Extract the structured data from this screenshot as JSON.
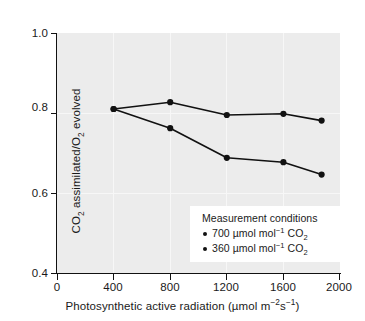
{
  "chart_data": {
    "type": "line",
    "title": "",
    "xlabel": "Photosynthetic active radiation (µmol m⁻²s⁻¹)",
    "ylabel": "CO₂ assimilated/O₂ evolved",
    "xlim": [
      0,
      2000
    ],
    "ylim": [
      0.4,
      1.0
    ],
    "xticks": [
      0,
      400,
      800,
      1200,
      1600,
      2000
    ],
    "xtick_labels": [
      "0",
      "400",
      "800",
      "1200",
      "1600",
      "2000"
    ],
    "yticks": [
      0.4,
      0.6,
      0.8,
      1.0
    ],
    "ytick_labels": [
      "0.4",
      "0.6",
      "0.8",
      "1.0"
    ],
    "grid": true,
    "legend_position": "lower right",
    "legend_title": "Measurement conditions",
    "marker": "circle-filled",
    "series": [
      {
        "name": "700 µmol mol⁻¹ CO₂",
        "x": [
          400,
          800,
          1200,
          1600,
          1870
        ],
        "y": [
          0.81,
          0.827,
          0.795,
          0.798,
          0.781
        ]
      },
      {
        "name": "360 µmol mol⁻¹ CO₂",
        "x": [
          400,
          800,
          1200,
          1600,
          1870
        ],
        "y": [
          0.81,
          0.762,
          0.688,
          0.677,
          0.646
        ]
      }
    ],
    "colors": {
      "line": "#111111",
      "marker": "#111111",
      "plot_background": "#ececec",
      "gridline": "#f7f7f7",
      "figure_background": "#ffffff",
      "axis": "#111111"
    }
  },
  "axes": {
    "ylabel_parts": {
      "a": "CO",
      "a_sub": "2",
      "b": " assimilated/O",
      "b_sub": "2",
      "c": " evolved"
    },
    "xlabel_parts": {
      "a": "Photosynthetic active radiation (µmol m",
      "a_sup": "−2",
      "b": "s",
      "b_sup": "−1",
      "c": ")"
    }
  },
  "legend": {
    "title": "Measurement conditions",
    "entries": [
      {
        "value": "700",
        "unit_a": " µmol mol",
        "unit_sup": "−1",
        "unit_b": " CO",
        "unit_sub": "2"
      },
      {
        "value": "360",
        "unit_a": " µmol mol",
        "unit_sup": "−1",
        "unit_b": " CO",
        "unit_sub": "2"
      }
    ]
  }
}
